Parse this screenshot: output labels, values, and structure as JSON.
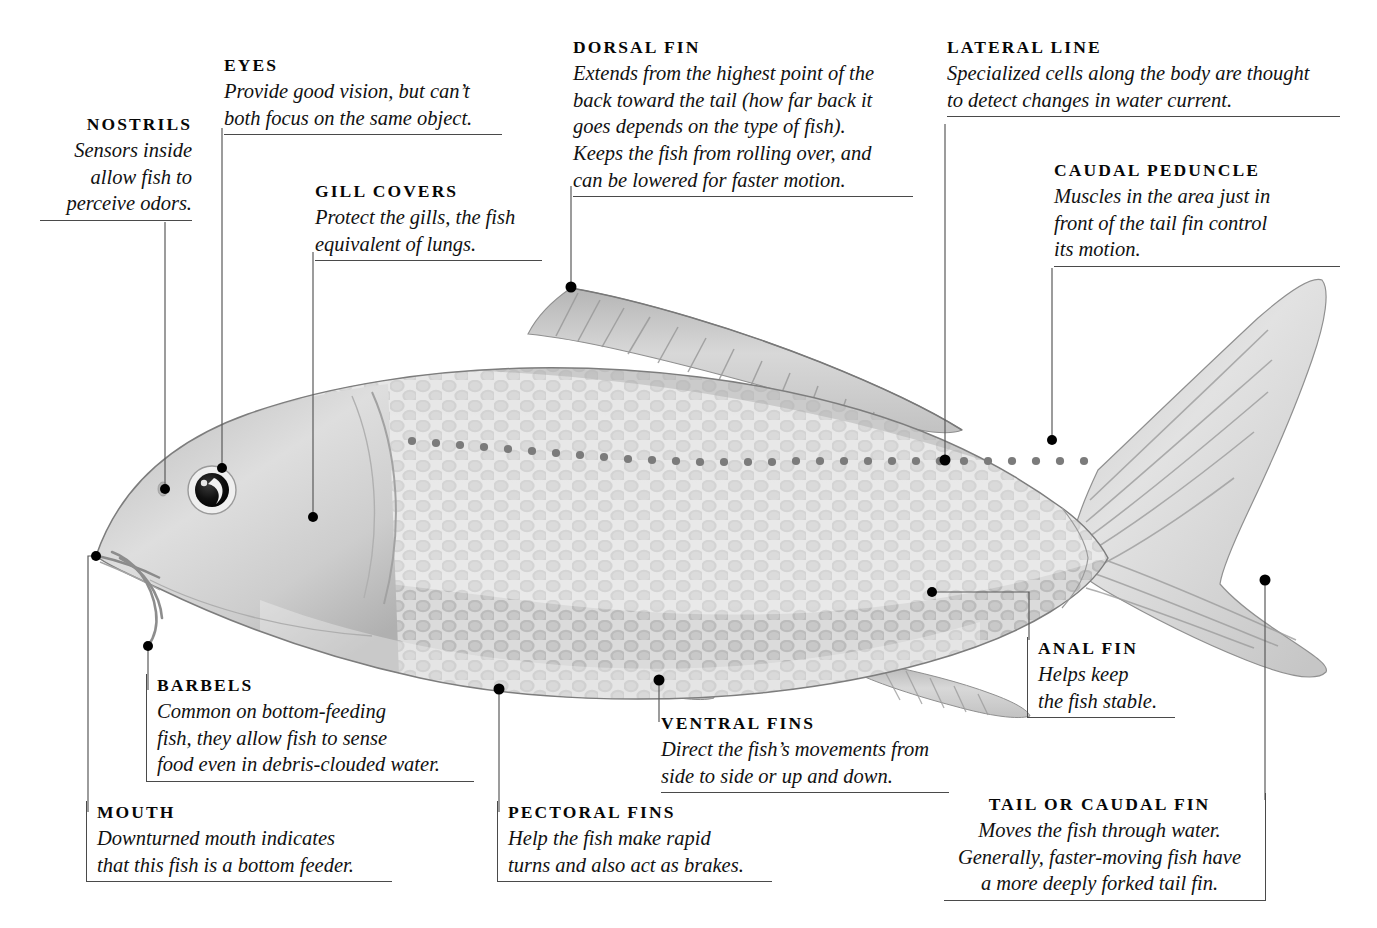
{
  "diagram": {
    "subject": "fish",
    "style": "grayscale watercolor illustration with callout labels",
    "background_color": "#ffffff",
    "leader_color": "#5a5a5a",
    "rule_color": "#4a4a4a",
    "text_color": "#0d0d0d"
  },
  "callouts": [
    {
      "id": "nostrils",
      "heading": "NOSTRILS",
      "lines": [
        "Sensors inside",
        "allow fish to",
        "perceive odors."
      ],
      "align": "right"
    },
    {
      "id": "eyes",
      "heading": "EYES",
      "lines": [
        "Provide good vision, but can’t",
        "both focus on the same object."
      ],
      "align": "left"
    },
    {
      "id": "gill-covers",
      "heading": "GILL COVERS",
      "lines": [
        "Protect the gills, the fish",
        "equivalent of lungs."
      ],
      "align": "left"
    },
    {
      "id": "dorsal-fin",
      "heading": "DORSAL FIN",
      "lines": [
        "Extends from the highest point of the",
        "back toward the tail (how far back it",
        "goes depends on the type of fish).",
        "Keeps the fish from rolling over, and",
        "can be lowered for faster motion."
      ],
      "align": "left"
    },
    {
      "id": "lateral-line",
      "heading": "LATERAL LINE",
      "lines": [
        "Specialized cells along the body are thought",
        "to detect changes in water current."
      ],
      "align": "left"
    },
    {
      "id": "caudal-peduncle",
      "heading": "CAUDAL PEDUNCLE",
      "lines": [
        "Muscles in the area just in",
        "front of the tail fin control",
        "its motion."
      ],
      "align": "left"
    },
    {
      "id": "barbels",
      "heading": "BARBELS",
      "lines": [
        "Common on bottom-feeding",
        "fish, they allow fish to sense",
        "food even in debris-clouded water."
      ],
      "align": "left"
    },
    {
      "id": "mouth",
      "heading": "MOUTH",
      "lines": [
        "Downturned mouth indicates",
        "that this fish is a bottom feeder."
      ],
      "align": "left"
    },
    {
      "id": "pectoral-fins",
      "heading": "PECTORAL FINS",
      "lines": [
        "Help the fish make rapid",
        "turns and also act as brakes."
      ],
      "align": "left"
    },
    {
      "id": "ventral-fins",
      "heading": "VENTRAL FINS",
      "lines": [
        "Direct the fish’s movements from",
        "side to side or up and down."
      ],
      "align": "left"
    },
    {
      "id": "anal-fin",
      "heading": "ANAL FIN",
      "lines": [
        "Helps keep",
        "the fish stable."
      ],
      "align": "left"
    },
    {
      "id": "tail-or-caudal-fin",
      "heading": "TAIL OR CAUDAL FIN",
      "lines": [
        "Moves the fish through water.",
        "Generally, faster-moving fish have",
        "a more deeply forked tail fin."
      ],
      "align": "center"
    }
  ],
  "anatomy_parts": [
    "nostrils",
    "eyes",
    "gill covers",
    "dorsal fin",
    "lateral line",
    "caudal peduncle",
    "barbels",
    "mouth",
    "pectoral fins",
    "ventral fins",
    "anal fin",
    "tail or caudal fin"
  ]
}
